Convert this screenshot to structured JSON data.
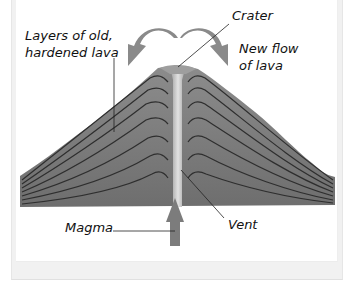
{
  "diagram": {
    "labels": {
      "layers_line1": "Layers of old,",
      "layers_line2": "hardened lava",
      "crater": "Crater",
      "new_flow_line1": "New flow",
      "new_flow_line2": "of lava",
      "magma": "Magma",
      "vent": "Vent"
    },
    "colors": {
      "volcano_body": "#808080",
      "layer_lines": "#2e2e2e",
      "vent": "#d2d2d2",
      "arrows": "#8a8a8a",
      "magma_arrow": "#7c7c7c",
      "leader_lines": "#222222",
      "frame": "#f1f1f1"
    },
    "components": [
      {
        "name": "crater",
        "description": "opening at the top of the volcano"
      },
      {
        "name": "vent",
        "description": "central channel through which magma rises"
      },
      {
        "name": "magma",
        "description": "molten rock rising from below, shown by upward arrow"
      },
      {
        "name": "layers of old, hardened lava",
        "description": "stacked strata forming the cone"
      },
      {
        "name": "new flow of lava",
        "description": "curved arrows flowing down both flanks from crater"
      }
    ]
  }
}
